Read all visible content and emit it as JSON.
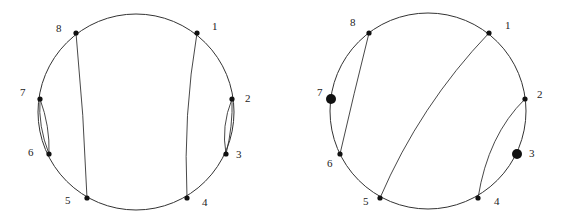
{
  "diagrams": [
    {
      "name": "left",
      "labels": [
        "1",
        "2",
        "3",
        "4",
        "5",
        "6",
        "7",
        "8"
      ],
      "chords": [
        [
          "8",
          "5"
        ],
        [
          "1",
          "4"
        ],
        [
          "7",
          "6"
        ],
        [
          "2",
          "3"
        ]
      ],
      "large_points": []
    },
    {
      "name": "right",
      "labels": [
        "1",
        "2",
        "3",
        "4",
        "5",
        "6",
        "7",
        "8"
      ],
      "chords": [
        [
          "8",
          "6"
        ],
        [
          "1",
          "5"
        ],
        [
          "2",
          "4"
        ]
      ],
      "large_points": [
        "7",
        "3"
      ]
    }
  ]
}
